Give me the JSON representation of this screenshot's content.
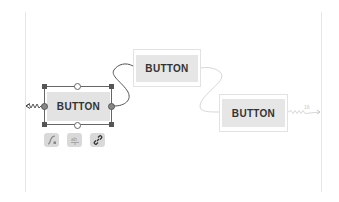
{
  "editor": {
    "type": "constraint-layout-blueprint",
    "colors": {
      "selection": "#555555",
      "button_fill": "#e6e6e6",
      "constraint_line": "#555555",
      "faint_constraint": "#d8d8d8"
    }
  },
  "widgets": [
    {
      "id": "button-1",
      "label": "BUTTON",
      "selected": true
    },
    {
      "id": "button-2",
      "label": "BUTTON",
      "selected": false
    },
    {
      "id": "button-3",
      "label": "BUTTON",
      "selected": false
    }
  ],
  "selection_toolbar": {
    "items": [
      {
        "icon": "clear-constraints-icon",
        "label": "Clear constraints"
      },
      {
        "icon": "baseline-ab-icon",
        "label": "Edit baseline"
      },
      {
        "icon": "chain-link-icon",
        "label": "Chain"
      }
    ]
  },
  "margins": {
    "right_constraint": "16"
  }
}
